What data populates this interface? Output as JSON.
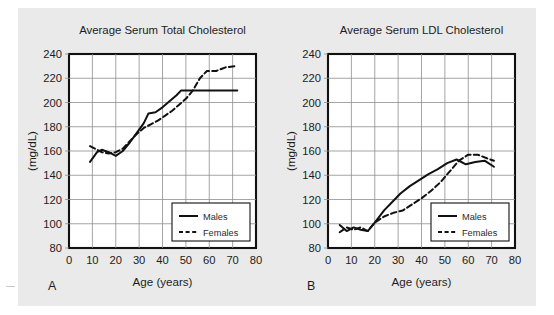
{
  "figure": {
    "background_color": "#ffffff",
    "panel_background_color": "#eaeaea",
    "line_color": "#111111",
    "grid_color": "#8e8e8e"
  },
  "panels": [
    {
      "letter": "A",
      "title": "Average Serum Total Cholesterol",
      "xlabel": "Age (years)",
      "ylabel": "(mg/dL)",
      "legend": [
        {
          "label": "Males",
          "style": "solid"
        },
        {
          "label": "Females",
          "style": "dashed"
        }
      ]
    },
    {
      "letter": "B",
      "title": "Average Serum LDL Cholesterol",
      "xlabel": "Age (years)",
      "ylabel": "(mg/dL)",
      "legend": [
        {
          "label": "Males",
          "style": "solid"
        },
        {
          "label": "Females",
          "style": "dashed"
        }
      ]
    }
  ],
  "chart_data": [
    {
      "type": "line",
      "panel": "A",
      "title": "Average Serum Total Cholesterol",
      "xlabel": "Age (years)",
      "ylabel": "(mg/dL)",
      "xlim": [
        0,
        80
      ],
      "ylim": [
        80,
        240
      ],
      "xticks": [
        0,
        10,
        20,
        30,
        40,
        50,
        60,
        70,
        80
      ],
      "yticks": [
        80,
        100,
        120,
        140,
        160,
        180,
        200,
        220,
        240
      ],
      "grid": true,
      "legend_position": "lower right",
      "series": [
        {
          "name": "Males",
          "style": "solid",
          "x": [
            9,
            12,
            14,
            17,
            20,
            23,
            26,
            29,
            32,
            34,
            37,
            40,
            43,
            46,
            48,
            52,
            57,
            62,
            67,
            72
          ],
          "values": [
            151,
            159,
            161,
            159,
            156,
            160,
            167,
            175,
            183,
            191,
            192,
            196,
            201,
            206,
            210,
            210,
            210,
            210,
            210,
            210
          ]
        },
        {
          "name": "Females",
          "style": "dashed",
          "x": [
            9,
            12,
            14,
            17,
            20,
            23,
            26,
            29,
            32,
            35,
            38,
            41,
            44,
            47,
            50,
            53,
            56,
            59,
            63,
            67,
            71
          ],
          "values": [
            164,
            161,
            159,
            158,
            159,
            162,
            168,
            174,
            179,
            182,
            185,
            189,
            193,
            198,
            203,
            210,
            220,
            226,
            226,
            229,
            230
          ]
        }
      ]
    },
    {
      "type": "line",
      "panel": "B",
      "title": "Average Serum LDL Cholesterol",
      "xlabel": "Age (years)",
      "ylabel": "(mg/dL)",
      "xlim": [
        0,
        80
      ],
      "ylim": [
        80,
        240
      ],
      "xticks": [
        0,
        10,
        20,
        30,
        40,
        50,
        60,
        70,
        80
      ],
      "yticks": [
        80,
        100,
        120,
        140,
        160,
        180,
        200,
        220,
        240
      ],
      "grid": true,
      "legend_position": "lower right",
      "series": [
        {
          "name": "Males",
          "style": "solid",
          "x": [
            5,
            8,
            11,
            14,
            17,
            20,
            24,
            28,
            31,
            35,
            39,
            43,
            47,
            51,
            55,
            59,
            63,
            67,
            71
          ],
          "values": [
            99,
            94,
            97,
            95,
            94,
            101,
            111,
            119,
            125,
            131,
            136,
            141,
            145,
            150,
            153,
            149,
            151,
            152,
            147
          ]
        },
        {
          "name": "Females",
          "style": "dashed",
          "x": [
            5,
            8,
            11,
            14,
            17,
            20,
            24,
            28,
            32,
            36,
            40,
            44,
            48,
            52,
            56,
            60,
            64,
            68,
            71
          ],
          "values": [
            93,
            97,
            95,
            97,
            94,
            101,
            106,
            109,
            111,
            116,
            121,
            127,
            134,
            143,
            152,
            157,
            157,
            154,
            152
          ]
        }
      ]
    }
  ]
}
